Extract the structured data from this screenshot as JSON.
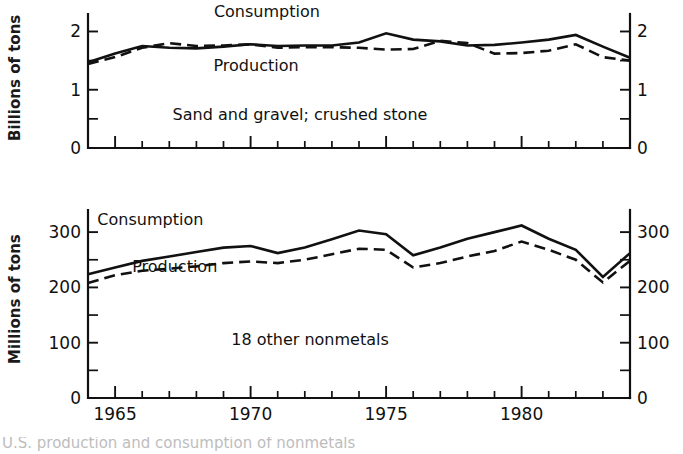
{
  "figure": {
    "partial_caption": "U.S. production and consumption of nonmetals",
    "x_axis": {
      "label": "",
      "tick_labels": [
        "1965",
        "1970",
        "1975",
        "1980"
      ],
      "tick_values": [
        1965,
        1970,
        1975,
        1980
      ],
      "range": [
        1964,
        1984
      ],
      "minor_tick_interval": 1,
      "major_tick_interval": 5
    }
  },
  "chart_data": [
    {
      "id": "sand-gravel-crushed-stone",
      "type": "line",
      "title": "",
      "annotation": "Sand and gravel; crushed stone",
      "xlabel": "",
      "ylabel": "Billions of tons",
      "ylim": [
        0,
        2.3
      ],
      "ytick_labels": [
        "0",
        "1",
        "2"
      ],
      "ytick_values": [
        0,
        1,
        2
      ],
      "yminor_values": [
        0.5,
        1.5
      ],
      "right_axis_labels": [
        "0",
        "1",
        "2"
      ],
      "grid": false,
      "legend": "inline-annotations",
      "x": [
        1964,
        1965,
        1966,
        1967,
        1968,
        1969,
        1970,
        1971,
        1972,
        1973,
        1974,
        1975,
        1976,
        1977,
        1978,
        1979,
        1980,
        1981,
        1982,
        1983,
        1984
      ],
      "series": [
        {
          "name": "Consumption",
          "style": "solid",
          "label_x": 1970.6,
          "label_y": 2.25,
          "values": [
            1.47,
            1.62,
            1.75,
            1.72,
            1.71,
            1.74,
            1.78,
            1.75,
            1.76,
            1.76,
            1.81,
            1.97,
            1.86,
            1.83,
            1.76,
            1.77,
            1.81,
            1.86,
            1.94,
            1.74,
            1.55,
            1.39,
            1.62,
            1.66
          ]
        },
        {
          "name": "Production",
          "style": "dashed",
          "label_x": 1970.2,
          "label_y": 1.33,
          "values": [
            1.44,
            1.56,
            1.72,
            1.8,
            1.75,
            1.76,
            1.78,
            1.72,
            1.73,
            1.73,
            1.72,
            1.69,
            1.7,
            1.84,
            1.8,
            1.62,
            1.63,
            1.67,
            1.78,
            1.56,
            1.5,
            1.35,
            1.52,
            1.63
          ]
        }
      ]
    },
    {
      "id": "18-other-nonmetals",
      "type": "line",
      "title": "",
      "annotation": "18 other nonmetals",
      "xlabel": "",
      "ylabel": "Millions of tons",
      "ylim": [
        0,
        340
      ],
      "ytick_labels": [
        "0",
        "100",
        "200",
        "300"
      ],
      "ytick_values": [
        0,
        100,
        200,
        300
      ],
      "yminor_values": [
        50,
        150,
        250
      ],
      "right_axis_labels": [
        "0",
        "100",
        "200",
        "300"
      ],
      "grid": false,
      "legend": "inline-annotations",
      "x": [
        1964,
        1965,
        1966,
        1967,
        1968,
        1969,
        1970,
        1971,
        1972,
        1973,
        1974,
        1975,
        1976,
        1977,
        1978,
        1979,
        1980,
        1981,
        1982,
        1983,
        1984
      ],
      "series": [
        {
          "name": "Consumption",
          "style": "solid",
          "label_x": 1966.3,
          "label_y": 312,
          "values": [
            224,
            236,
            248,
            256,
            264,
            272,
            275,
            262,
            272,
            287,
            303,
            296,
            258,
            272,
            288,
            300,
            312,
            288,
            268,
            219,
            262,
            286
          ]
        },
        {
          "name": "Production",
          "style": "dashed",
          "label_x": 1967.2,
          "label_y": 228,
          "values": [
            208,
            222,
            230,
            234,
            238,
            244,
            247,
            244,
            250,
            260,
            270,
            268,
            236,
            244,
            256,
            266,
            283,
            268,
            250,
            209,
            248,
            272
          ]
        }
      ]
    }
  ]
}
